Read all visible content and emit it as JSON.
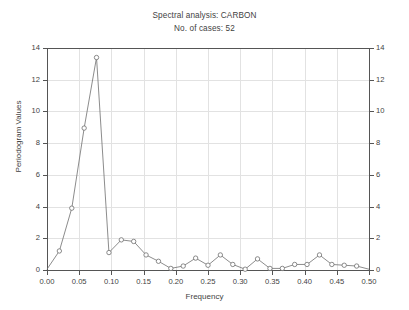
{
  "header": {
    "title": "Spectral analysis: CARBON",
    "subtitle": "No. of cases: 52"
  },
  "chart_data": {
    "type": "line",
    "title": "Spectral analysis: CARBON",
    "subtitle": "No. of cases: 52",
    "xlabel": "Frequency",
    "ylabel": "Periodogram Values",
    "ylabel_right": "Periodogram Values",
    "xlim": [
      0.0,
      0.5
    ],
    "ylim": [
      0,
      14
    ],
    "grid": true,
    "legend": "none",
    "markers": "open-circle",
    "line_color": "#6e6e6e",
    "marker_fill": "#ffffff",
    "xticks": [
      "0.00",
      "0.05",
      "0.10",
      "0.15",
      "0.20",
      "0.25",
      "0.30",
      "0.35",
      "0.40",
      "0.45",
      "0.50"
    ],
    "xtick_values": [
      0.0,
      0.05,
      0.1,
      0.15,
      0.2,
      0.25,
      0.3,
      0.35,
      0.4,
      0.45,
      0.5
    ],
    "yticks": [
      "0",
      "2",
      "4",
      "6",
      "8",
      "10",
      "12",
      "14"
    ],
    "ytick_values": [
      0,
      2,
      4,
      6,
      8,
      10,
      12,
      14
    ],
    "yticks_right": [
      "0",
      "2",
      "4",
      "6",
      "8",
      "10",
      "12",
      "14"
    ],
    "x": [
      0.0,
      0.0192,
      0.0385,
      0.0577,
      0.0769,
      0.0962,
      0.1154,
      0.1346,
      0.1538,
      0.1731,
      0.1923,
      0.2115,
      0.2308,
      0.25,
      0.2692,
      0.2885,
      0.3077,
      0.3269,
      0.3462,
      0.3654,
      0.3846,
      0.4038,
      0.4231,
      0.4423,
      0.4615,
      0.4808,
      0.5
    ],
    "y": [
      0.05,
      1.2,
      3.9,
      8.95,
      13.4,
      1.1,
      1.9,
      1.8,
      0.95,
      0.55,
      0.1,
      0.25,
      0.75,
      0.3,
      0.95,
      0.35,
      0.05,
      0.7,
      0.1,
      0.1,
      0.35,
      0.35,
      0.95,
      0.35,
      0.3,
      0.25,
      0.05
    ],
    "series": [
      {
        "name": "Periodogram",
        "values": [
          0.05,
          1.2,
          3.9,
          8.95,
          13.4,
          1.1,
          1.9,
          1.8,
          0.95,
          0.55,
          0.1,
          0.25,
          0.75,
          0.3,
          0.95,
          0.35,
          0.05,
          0.7,
          0.1,
          0.1,
          0.35,
          0.35,
          0.95,
          0.35,
          0.3,
          0.25,
          0.05
        ]
      }
    ]
  }
}
